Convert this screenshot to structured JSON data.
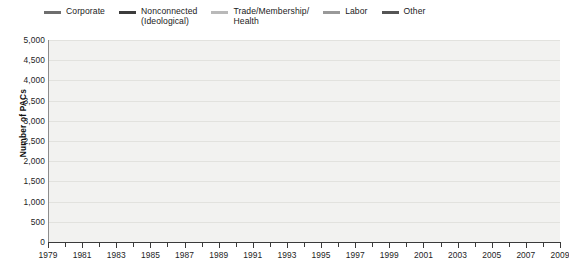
{
  "chart_data": {
    "type": "line",
    "title": "",
    "xlabel": "",
    "ylabel": "Number of PACs",
    "xlim": [
      1979,
      2009
    ],
    "ylim": [
      0,
      5000
    ],
    "ytick_step": 500,
    "grid": true,
    "legend_position": "top",
    "x": [
      1979,
      1980,
      1981,
      1982,
      1983,
      1984,
      1985,
      1986,
      1987,
      1988,
      1989,
      1990,
      1991,
      1992,
      1993,
      1994,
      1995,
      1996,
      1997,
      1998,
      1999,
      2000,
      2001,
      2002,
      2003,
      2004,
      2005,
      2006,
      2007,
      2008,
      2009
    ],
    "ytick_labels": [
      "5,000",
      "4,500",
      "4,000",
      "3,500",
      "3,000",
      "2,500",
      "2,000",
      "1,500",
      "1,000",
      "500",
      "0"
    ],
    "xtick_labels": [
      "1979",
      "1981",
      "1983",
      "1985",
      "1987",
      "1989",
      "1991",
      "1993",
      "1995",
      "1997",
      "1999",
      "2001",
      "2003",
      "2005",
      "2007",
      "2009"
    ],
    "series": [
      {
        "name": "Corporate",
        "color": "#6e6e6e",
        "values": [
          900,
          1050,
          1250,
          1450,
          1550,
          1680,
          1700,
          1710,
          1720,
          1730,
          1780,
          1760,
          1740,
          1730,
          1740,
          1700,
          1660,
          1650,
          1640,
          1600,
          1570,
          1550,
          1540,
          120,
          120,
          120,
          120,
          120,
          120,
          120,
          130
        ]
      },
      {
        "name": "Nonconnected\n(Ideological)",
        "color": "#3c3c3c",
        "values": [
          160,
          220,
          320,
          480,
          620,
          800,
          950,
          980,
          1050,
          1100,
          1060,
          1050,
          1080,
          1140,
          1120,
          1050,
          1020,
          1030,
          1020,
          1020,
          1030,
          1030,
          1020,
          1000,
          1020,
          1010,
          1010,
          1000,
          1150,
          1380,
          1580
        ]
      },
      {
        "name": "Trade/Membership/\nHealth",
        "color": "#b9b9b9",
        "values": [
          500,
          540,
          600,
          680,
          720,
          760,
          780,
          760,
          770,
          790,
          830,
          810,
          790,
          800,
          790,
          790,
          780,
          790,
          800,
          820,
          830,
          840,
          960,
          250,
          1450,
          1700,
          1620,
          1300,
          200,
          190,
          200
        ]
      },
      {
        "name": "Labor",
        "color": "#999999",
        "values": [
          230,
          250,
          290,
          360,
          380,
          400,
          400,
          400,
          400,
          400,
          390,
          380,
          370,
          370,
          360,
          350,
          340,
          340,
          330,
          330,
          320,
          320,
          320,
          100,
          95,
          95,
          95,
          95,
          95,
          95,
          95
        ]
      },
      {
        "name": "Other",
        "color": "#555555",
        "values": [
          40,
          60,
          90,
          140,
          200,
          280,
          330,
          300,
          270,
          250,
          230,
          200,
          180,
          170,
          160,
          150,
          150,
          150,
          140,
          130,
          120,
          110,
          100,
          1550,
          4200,
          4750,
          3450,
          1480,
          1500,
          1520,
          1580
        ]
      }
    ]
  }
}
